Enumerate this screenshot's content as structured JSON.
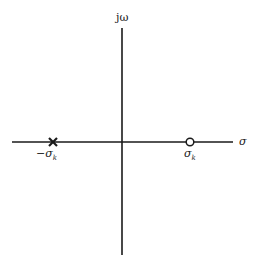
{
  "diagram": {
    "type": "s-plane pole-zero plot",
    "axes": {
      "vertical_label": "jω",
      "horizontal_label": "σ"
    },
    "pole": {
      "marker": "×",
      "label_prefix": "−σ",
      "label_subscript": "k"
    },
    "zero": {
      "marker": "○",
      "label_prefix": "σ",
      "label_subscript": "k"
    },
    "colors": {
      "ink": "#1a1a1a",
      "background": "#ffffff"
    }
  }
}
